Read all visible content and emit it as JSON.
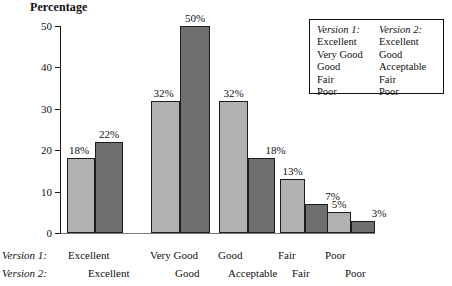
{
  "chart_data": {
    "type": "bar",
    "title": "Percentage",
    "xlabel": "",
    "ylabel": "Percentage",
    "ylim": [
      0,
      50
    ],
    "yticks": [
      0,
      10,
      20,
      30,
      40,
      50
    ],
    "ytick_labels": [
      "0",
      "10",
      "20",
      "30",
      "40",
      "50"
    ],
    "grid": false,
    "legend_position": "top-right",
    "categories": [
      "Excellent",
      "Very Good",
      "Good",
      "Fair",
      "Poor"
    ],
    "categories_version2": [
      "Excellent",
      "Good",
      "Acceptable",
      "Fair",
      "Poor"
    ],
    "series": [
      {
        "name": "Version 1",
        "values": [
          18,
          32,
          32,
          13,
          5
        ],
        "data_labels": [
          "18%",
          "32%",
          "32%",
          "13%",
          "5%"
        ],
        "color": "#b2b2b2"
      },
      {
        "name": "Version 2",
        "values": [
          22,
          50,
          18,
          7,
          3
        ],
        "data_labels": [
          "22%",
          "50%",
          "18%",
          "7%",
          "3%"
        ],
        "color": "#6f6f6f"
      }
    ]
  },
  "legend": {
    "columns": [
      {
        "header": "Version 1:",
        "items": [
          "Excellent",
          "Very Good",
          "Good",
          "Fair",
          "Poor"
        ]
      },
      {
        "header": "Version 2:",
        "items": [
          "Excellent",
          "Good",
          "Acceptable",
          "Fair",
          "Poor"
        ]
      }
    ]
  },
  "axis_rows": {
    "row1_label": "Version 1:",
    "row2_label": "Version 2:"
  }
}
